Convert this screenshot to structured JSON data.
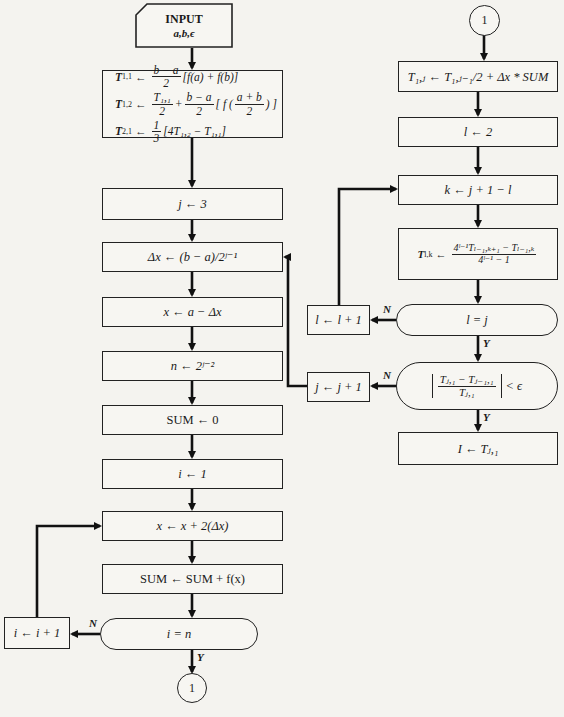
{
  "left_column": {
    "input": {
      "heading": "INPUT",
      "params": "a,b,ϵ"
    },
    "init": {
      "line1": {
        "lhs": "T",
        "lhs_sub": "1,1",
        "arrow": "←",
        "frac_num": "b − a",
        "frac_den": "2",
        "rest": "[f(a) + f(b)]"
      },
      "line2": {
        "lhs": "T",
        "lhs_sub": "1,2",
        "arrow": "←",
        "frac1_num": "T₁,₁",
        "frac1_den": "2",
        "plus": "+",
        "frac2_num": "b − a",
        "frac2_den": "2",
        "rest_open": "[ f (",
        "frac3_num": "a + b",
        "frac3_den": "2",
        "rest_close": ") ]"
      },
      "line3": {
        "lhs": "T",
        "lhs_sub": "2,1",
        "arrow": "←",
        "frac_num": "1",
        "frac_den": "3",
        "rest": "[4T₁,₂ − T₁,₁]"
      }
    },
    "j_init": "j ← 3",
    "dx": "Δx ← (b − a)/2ʲ⁻¹",
    "x_init": "x ← a − Δx",
    "n_init": "n ← 2ʲ⁻²",
    "sum_init": "SUM ← 0",
    "i_init": "i ← 1",
    "x_step": "x ← x + 2(Δx)",
    "sum_step": "SUM ← SUM + f(x)",
    "decision_i": "i = n",
    "i_incr": "i ← i + 1",
    "connector_out": "1",
    "labels": {
      "no": "N",
      "yes": "Y"
    }
  },
  "right_column": {
    "connector_in": "1",
    "t1j": "T₁,ⱼ ← T₁,ⱼ₋₁/2 + Δx * SUM",
    "l_init": "l ← 2",
    "k_assign": "k ← j + 1 − l",
    "tlk": {
      "lhs": "T",
      "lhs_sub": "l,k",
      "arrow": "←",
      "num": "4ˡ⁻¹Tₗ₋₁,ₖ₊₁ − Tₗ₋₁,ₖ",
      "den": "4ˡ⁻¹ − 1"
    },
    "decision_l": "l = j",
    "l_incr": "l ← l + 1",
    "decision_conv": {
      "num": "Tⱼ,₁ − Tⱼ₋₁,₁",
      "den": "Tⱼ,₁",
      "rel": "< ϵ"
    },
    "j_incr": "j ← j + 1",
    "result": "I ← Tⱼ,₁",
    "labels": {
      "no": "N",
      "yes": "Y"
    }
  }
}
